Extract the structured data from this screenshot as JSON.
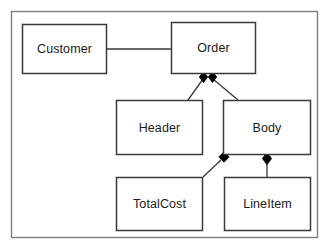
{
  "diagram": {
    "type": "uml-class-diagram",
    "frame": {
      "label": "diagram-frame",
      "x": 11,
      "y": 11,
      "width": 307,
      "height": 227,
      "border_color": "#7d7d7d",
      "fill_color": "#ffffff"
    },
    "style": {
      "box_border_color": "#3a3a3a",
      "box_fill_color": "#ffffff",
      "connector_color": "#3a3a3a",
      "diamond_fill_color": "#000000",
      "text_color": "#1c1c1c"
    },
    "classes": [
      {
        "id": "customer",
        "label": "Customer",
        "x": 22,
        "y": 24,
        "width": 85,
        "height": 50
      },
      {
        "id": "order",
        "label": "Order",
        "x": 171,
        "y": 22,
        "width": 85,
        "height": 52
      },
      {
        "id": "header",
        "label": "Header",
        "x": 116,
        "y": 100,
        "width": 87,
        "height": 55
      },
      {
        "id": "body",
        "label": "Body",
        "x": 223,
        "y": 100,
        "width": 88,
        "height": 55
      },
      {
        "id": "totalcost",
        "label": "TotalCost",
        "x": 116,
        "y": 177,
        "width": 87,
        "height": 54
      },
      {
        "id": "lineitem",
        "label": "LineItem",
        "x": 224,
        "y": 177,
        "width": 87,
        "height": 54
      }
    ],
    "connectors": [
      {
        "id": "customer-order",
        "kind": "association",
        "from": "customer",
        "to": "order",
        "path": "M107,49 L171,49",
        "diamond": null
      },
      {
        "id": "order-header",
        "kind": "composition",
        "from": "order",
        "to": "header",
        "path": "M203,78 L188,100",
        "diamond": {
          "cx": 203.5,
          "cy": 77,
          "rx": 4.2,
          "ry": 5.6
        }
      },
      {
        "id": "order-body",
        "kind": "composition",
        "from": "order",
        "to": "body",
        "path": "M213,78 L238,100",
        "diamond": {
          "cx": 212.5,
          "cy": 77,
          "rx": 4.2,
          "ry": 5.6
        }
      },
      {
        "id": "body-totalcost",
        "kind": "composition",
        "from": "body",
        "to": "totalcost",
        "path": "M222,159 L203,177",
        "diamond": {
          "cx": 224,
          "cy": 157,
          "rx": 5.2,
          "ry": 5.2
        }
      },
      {
        "id": "body-lineitem",
        "kind": "composition",
        "from": "body",
        "to": "lineitem",
        "path": "M267,163 L267,177",
        "diamond": {
          "cx": 267,
          "cy": 158.5,
          "rx": 4.6,
          "ry": 6.2
        }
      }
    ]
  }
}
